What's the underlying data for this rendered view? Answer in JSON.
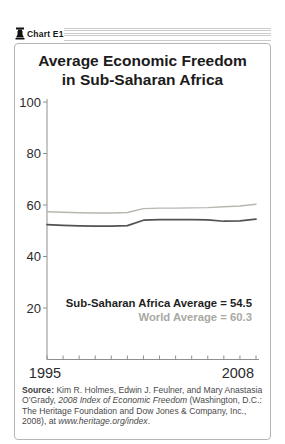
{
  "header": {
    "badge_label": "Chart E1",
    "logo_icon": "heritage-bell-icon"
  },
  "title": {
    "line1": "Average Economic Freedom",
    "line2": "in Sub-Saharan Africa"
  },
  "chart_data": {
    "type": "line",
    "title": "Average Economic Freedom in Sub-Saharan Africa",
    "x": [
      1995,
      1996,
      1997,
      1998,
      1999,
      2000,
      2001,
      2002,
      2003,
      2004,
      2005,
      2006,
      2007,
      2008
    ],
    "series": [
      {
        "name": "Sub-Saharan Africa",
        "color": "#525255",
        "stroke_width": 1.7,
        "values": [
          52.4,
          52.1,
          51.9,
          51.8,
          51.8,
          52.0,
          54.1,
          54.3,
          54.3,
          54.3,
          54.2,
          53.7,
          53.8,
          54.5
        ]
      },
      {
        "name": "World",
        "color": "#b7b7af",
        "stroke_width": 1.4,
        "values": [
          57.4,
          57.2,
          57.0,
          56.9,
          56.9,
          57.1,
          58.6,
          58.8,
          58.8,
          58.9,
          59.0,
          59.3,
          59.6,
          60.3
        ]
      }
    ],
    "ylim": [
      0,
      100
    ],
    "yticks": [
      20,
      40,
      60,
      80,
      100
    ],
    "xtick_labels": [
      "1995",
      "2008"
    ],
    "grid": false,
    "legend_position": "none",
    "axis_color": "#8f8f8f",
    "annotation_ssa": "Sub-Saharan Africa Average = 54.5",
    "annotation_world": "World Average = 60.3",
    "annotation_world_color": "#a9a9a3"
  },
  "source": {
    "parts": {
      "label": "Source: ",
      "authors": "Kim R. Holmes, Edwin J. Feulner, and Mary Anastasia O’Grady, ",
      "book": "2008 Index of Economic Freedom",
      "publisher": " (Washington, D.C.: The Heritage Foundation and Dow Jones & Company, Inc., 2008), at ",
      "url": "www.heritage.org/index",
      "period": "."
    }
  }
}
